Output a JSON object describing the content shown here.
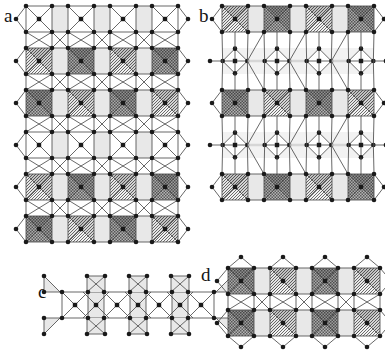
{
  "figure": {
    "type": "crystal-structure-diagram",
    "background_color": "#ffffff",
    "width": 385,
    "height": 362,
    "node_color": "#1a1a1a",
    "bond_color": "#4d4d4d",
    "face_color": "#e8e8e8",
    "fill_dark_color": "#8f8f8f",
    "fill_light_color": "#dcdcdc"
  },
  "panels": [
    {
      "id": "a",
      "label": "a",
      "label_x": 4,
      "label_y": 8,
      "origin_x": 26,
      "origin_y": 6,
      "pitch": 42,
      "square": 26,
      "cols": 4,
      "rows": 6,
      "description": "Two-dimensional square-polyhedron tiling with alternating filled sites",
      "fills": [
        {
          "row": 1,
          "col": 0,
          "type": "light"
        },
        {
          "row": 1,
          "col": 1,
          "type": "dark"
        },
        {
          "row": 1,
          "col": 2,
          "type": "light"
        },
        {
          "row": 1,
          "col": 3,
          "type": "dark"
        },
        {
          "row": 2,
          "col": 0,
          "type": "dark"
        },
        {
          "row": 2,
          "col": 1,
          "type": "light"
        },
        {
          "row": 2,
          "col": 2,
          "type": "dark"
        },
        {
          "row": 2,
          "col": 3,
          "type": "light"
        },
        {
          "row": 4,
          "col": 0,
          "type": "light"
        },
        {
          "row": 4,
          "col": 1,
          "type": "dark"
        },
        {
          "row": 4,
          "col": 2,
          "type": "light"
        },
        {
          "row": 4,
          "col": 3,
          "type": "dark"
        },
        {
          "row": 5,
          "col": 0,
          "type": "dark"
        },
        {
          "row": 5,
          "col": 1,
          "type": "light"
        },
        {
          "row": 5,
          "col": 2,
          "type": "dark"
        },
        {
          "row": 5,
          "col": 3,
          "type": "light"
        }
      ]
    },
    {
      "id": "b",
      "label": "b",
      "label_x": 199,
      "label_y": 8,
      "origin_x": 222,
      "origin_y": 6,
      "pitch": 42,
      "square": 26,
      "cols": 4,
      "rows": 6,
      "description": "Related tiling with tilted intermediate polyhedra between filled rows",
      "fills": [
        {
          "row": 0,
          "col": 0,
          "type": "light"
        },
        {
          "row": 0,
          "col": 1,
          "type": "dark"
        },
        {
          "row": 0,
          "col": 2,
          "type": "light"
        },
        {
          "row": 0,
          "col": 3,
          "type": "dark"
        },
        {
          "row": 2,
          "col": 0,
          "type": "dark"
        },
        {
          "row": 2,
          "col": 1,
          "type": "light"
        },
        {
          "row": 2,
          "col": 2,
          "type": "dark"
        },
        {
          "row": 2,
          "col": 3,
          "type": "light"
        },
        {
          "row": 4,
          "col": 0,
          "type": "light"
        },
        {
          "row": 4,
          "col": 1,
          "type": "dark"
        },
        {
          "row": 4,
          "col": 2,
          "type": "light"
        },
        {
          "row": 4,
          "col": 3,
          "type": "dark"
        }
      ]
    },
    {
      "id": "c",
      "label": "c",
      "label_x": 38,
      "label_y": 265,
      "origin_x": 62,
      "origin_y": 292,
      "pitch": 42,
      "square": 26,
      "cols": 4,
      "rows": 1,
      "description": "One-dimensional ribbon of corner-sharing square units, no occupied sites",
      "fills": []
    },
    {
      "id": "d",
      "label": "d",
      "label_x": 203,
      "label_y": 265,
      "origin_x": 228,
      "origin_y": 268,
      "pitch": 42,
      "square": 26,
      "cols": 4,
      "rows": 2,
      "description": "Two-row slab with fully occupied alternating sites",
      "fills": [
        {
          "row": 0,
          "col": 0,
          "type": "dark"
        },
        {
          "row": 0,
          "col": 1,
          "type": "light"
        },
        {
          "row": 0,
          "col": 2,
          "type": "dark"
        },
        {
          "row": 0,
          "col": 3,
          "type": "light"
        },
        {
          "row": 1,
          "col": 0,
          "type": "dark"
        },
        {
          "row": 1,
          "col": 1,
          "type": "light"
        },
        {
          "row": 1,
          "col": 2,
          "type": "dark"
        },
        {
          "row": 1,
          "col": 3,
          "type": "light"
        }
      ]
    }
  ]
}
